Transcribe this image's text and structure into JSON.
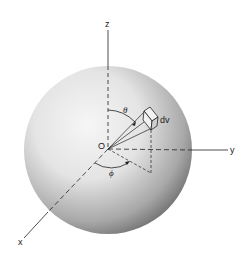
{
  "diagram": {
    "type": "spherical-coordinates-volume-element",
    "labels": {
      "z_axis": "z",
      "y_axis": "y",
      "x_axis": "x",
      "origin": "O",
      "theta": "θ",
      "phi": "ϕ",
      "volume_element": "dv"
    },
    "colors": {
      "sphere_light": "#f4f4f4",
      "sphere_dark": "#6a6a6a",
      "line": "#222222",
      "background": "#ffffff"
    }
  }
}
